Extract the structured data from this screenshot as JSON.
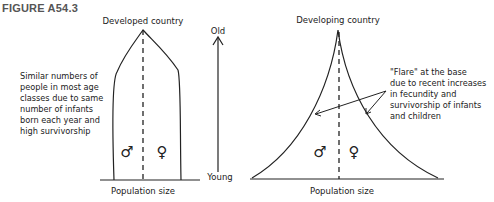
{
  "figure": {
    "label": "FIGURE A54.3"
  },
  "developed": {
    "title": "Developed country",
    "xlabel": "Population size",
    "male_symbol": "♂",
    "female_symbol": "♀",
    "annotation": "Similar numbers of\npeople in most age\nclasses due to same\nnumber of infants\nborn each year and\nhigh survivorship"
  },
  "age_axis": {
    "top_label": "Old",
    "bottom_label": "Young"
  },
  "developing": {
    "title": "Developing country",
    "xlabel": "Population size",
    "male_symbol": "♂",
    "female_symbol": "♀",
    "annotation": "\"Flare\" at the base\ndue to recent increases\nin fecundity and\nsurvivorship of infants\nand children"
  },
  "colors": {
    "ink": "#222222",
    "figure_label": "#555555",
    "background": "#ffffff"
  }
}
